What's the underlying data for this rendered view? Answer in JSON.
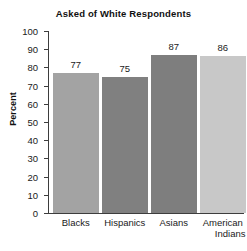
{
  "chart_data": {
    "type": "bar",
    "title": "Asked of White Respondents",
    "xlabel": "",
    "ylabel": "Percent",
    "categories": [
      "Blacks",
      "Hispanics",
      "Asians",
      "American Indians"
    ],
    "values": [
      77,
      75,
      87,
      86
    ],
    "value_labels": [
      "77",
      "75",
      "87",
      "86"
    ],
    "ylim": [
      0,
      100
    ],
    "ytick_step": 10,
    "yticks": [
      0,
      10,
      20,
      30,
      40,
      50,
      60,
      70,
      80,
      90,
      100
    ],
    "ytick_labels": [
      "0",
      "10",
      "20",
      "30",
      "40",
      "50",
      "60",
      "70",
      "80",
      "90",
      "100"
    ],
    "grid": false,
    "legend": false,
    "legend_position": "none",
    "bar_colors": [
      "#a3a3a3",
      "#808080",
      "#7e7e7e",
      "#c8c8c8"
    ],
    "axis_color": "#3d3d3d",
    "background": "#ffffff",
    "category_lines": [
      [
        "Blacks"
      ],
      [
        "Hispanics"
      ],
      [
        "Asians"
      ],
      [
        "American",
        "Indians"
      ]
    ]
  }
}
